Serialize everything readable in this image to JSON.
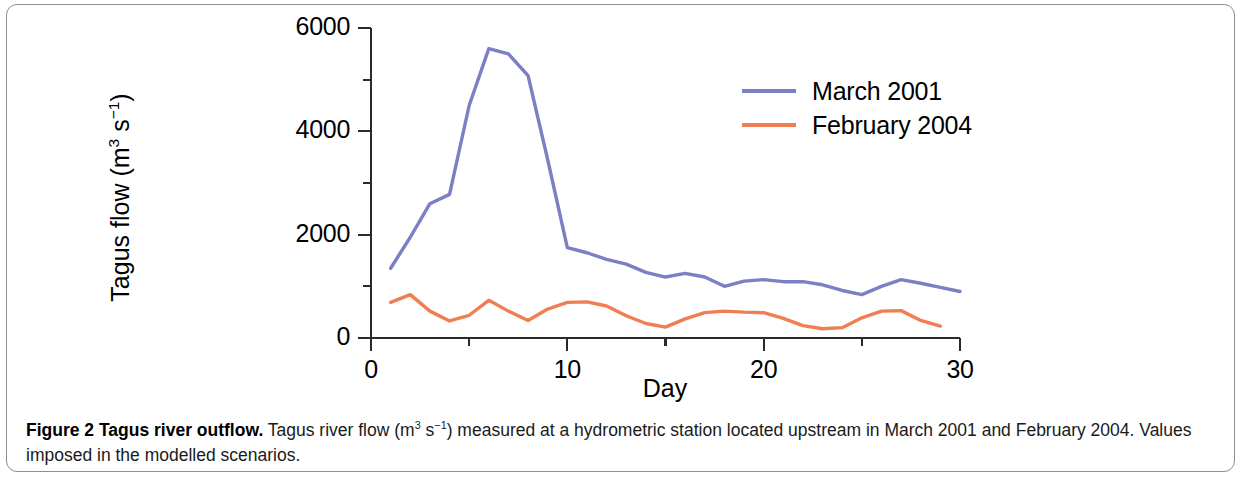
{
  "figure": {
    "caption_title": "Figure 2 Tagus river outflow.",
    "caption_body": " Tagus river flow (m3 s-1) measured at a hydrometric station located upstream in March 2001 and February 2004. Values imposed in the modelled scenarios.",
    "caption_body_pre": " Tagus river flow (m",
    "caption_sup_1": "3",
    "caption_mid": " s",
    "caption_sup_2": "−1",
    "caption_body_post": ") measured at a hydrometric station located upstream in March 2001 and February 2004. Values imposed in the modelled scenarios.",
    "border_color": "#8d8d8d"
  },
  "chart_data": {
    "type": "line",
    "title": "",
    "xlabel": "Day",
    "ylabel": "Tagus flow (m3 s-1)",
    "ylabel_parts": {
      "prefix": "Tagus flow (m",
      "sup1": "3",
      "mid": " s",
      "sup2": "−1",
      "suffix": ")"
    },
    "xlim": [
      0,
      30
    ],
    "ylim": [
      0,
      6000
    ],
    "xticks": [
      0,
      10,
      20,
      30
    ],
    "xticks_minor": [
      5,
      15,
      25
    ],
    "yticks": [
      0,
      2000,
      4000,
      6000
    ],
    "yticks_minor": [
      1000,
      3000,
      5000
    ],
    "grid": false,
    "legend_position": "upper-right",
    "series": [
      {
        "name": "March 2001",
        "color": "#7b7fc4",
        "x": [
          1,
          2,
          3,
          4,
          5,
          6,
          7,
          8,
          9,
          10,
          11,
          12,
          13,
          14,
          15,
          16,
          17,
          18,
          19,
          20,
          21,
          22,
          23,
          24,
          25,
          26,
          27,
          28,
          29,
          30
        ],
        "values": [
          1350,
          1950,
          2600,
          2780,
          4500,
          5600,
          5500,
          5080,
          3450,
          1750,
          1650,
          1520,
          1430,
          1270,
          1180,
          1250,
          1180,
          1000,
          1100,
          1130,
          1090,
          1090,
          1030,
          920,
          840,
          1000,
          1130,
          1060,
          980,
          900
        ]
      },
      {
        "name": "February 2004",
        "color": "#f07e52",
        "x": [
          1,
          2,
          3,
          4,
          5,
          6,
          7,
          8,
          9,
          10,
          11,
          12,
          13,
          14,
          15,
          16,
          17,
          18,
          19,
          20,
          21,
          22,
          23,
          24,
          25,
          26,
          27,
          28,
          29
        ],
        "values": [
          690,
          840,
          520,
          330,
          440,
          730,
          520,
          340,
          560,
          690,
          700,
          620,
          430,
          280,
          210,
          370,
          490,
          520,
          500,
          490,
          380,
          240,
          180,
          200,
          390,
          520,
          530,
          340,
          230
        ]
      }
    ]
  },
  "legend": {
    "items": [
      {
        "label": "March 2001",
        "color": "#7b7fc4"
      },
      {
        "label": "February 2004",
        "color": "#f07e52"
      }
    ]
  },
  "axis_labels": {
    "y": [
      "6000",
      "4000",
      "2000",
      "0"
    ],
    "x": [
      "0",
      "10",
      "20",
      "30"
    ],
    "x_title": "Day"
  }
}
